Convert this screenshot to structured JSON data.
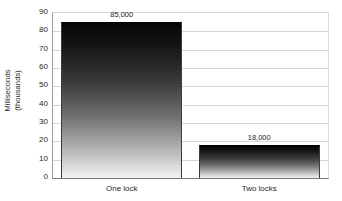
{
  "chart_data": {
    "type": "bar",
    "title": "",
    "subtitle": "",
    "xlabel": "",
    "ylabel": "Milliseconds (thousands)",
    "ylabel_lines": [
      "Milliseconds",
      "(thousands)"
    ],
    "categories": [
      "One lock",
      "Two locks"
    ],
    "values": [
      85000,
      18000
    ],
    "value_labels": [
      "85,000",
      "18,000"
    ],
    "plot_values_thousands": [
      85,
      18
    ],
    "ylim": [
      0,
      90
    ],
    "ytick_values": [
      0,
      10,
      20,
      30,
      40,
      50,
      60,
      70,
      80,
      90
    ],
    "ytick_labels": [
      "0",
      "10",
      "20",
      "30",
      "40",
      "50",
      "60",
      "70",
      "80",
      "90"
    ],
    "grid": true,
    "grid_axis": "y",
    "legend": false,
    "legend_position": "none",
    "series": [
      {
        "name": "Milliseconds",
        "values": [
          85,
          18
        ],
        "fill": "vertical-gradient-black-to-white",
        "color_top": "#050505",
        "color_bottom": "#f2f2f2"
      }
    ],
    "colors": {
      "background": "#ffffff",
      "gridline": "#d5d5d5",
      "axis_line": "#7a7a7a",
      "text": "#1f1f1f",
      "bar_top": "#050505",
      "bar_bottom": "#f2f2f2"
    }
  }
}
